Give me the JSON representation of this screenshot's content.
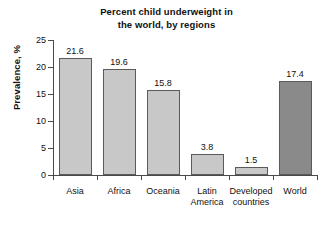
{
  "chart_data": {
    "type": "bar",
    "title": "Percent child underweight in the world, by regions",
    "title_lines": [
      "Percent child underweight in",
      "the world, by regions"
    ],
    "xlabel": "",
    "ylabel": "Prevalence, %",
    "ylim": [
      0,
      25
    ],
    "yticks": [
      0,
      5,
      10,
      15,
      20,
      25
    ],
    "ytick_labels": [
      "0",
      "5",
      "10",
      "15",
      "20",
      "25"
    ],
    "grid": false,
    "legend": "none",
    "categories": [
      "Asia",
      "Africa",
      "Oceania",
      "Latin America",
      "Developed countries",
      "World"
    ],
    "category_lines": [
      [
        "Asia",
        ""
      ],
      [
        "Africa",
        ""
      ],
      [
        "Oceania",
        ""
      ],
      [
        "Latin",
        "America"
      ],
      [
        "Developed",
        "countries"
      ],
      [
        "World",
        ""
      ]
    ],
    "values": [
      21.6,
      19.6,
      15.8,
      3.8,
      1.5,
      17.4
    ],
    "value_labels": [
      "21.6",
      "19.6",
      "15.8",
      "3.8",
      "1.5",
      "17.4"
    ],
    "bar_colors": [
      "#c8c8c8",
      "#c8c8c8",
      "#c8c8c8",
      "#c8c8c8",
      "#c8c8c8",
      "#8a8a8a"
    ],
    "bar_edge_color": "#5a5a5a",
    "axis_color": "#4a4a4a",
    "background": "#ffffff"
  }
}
